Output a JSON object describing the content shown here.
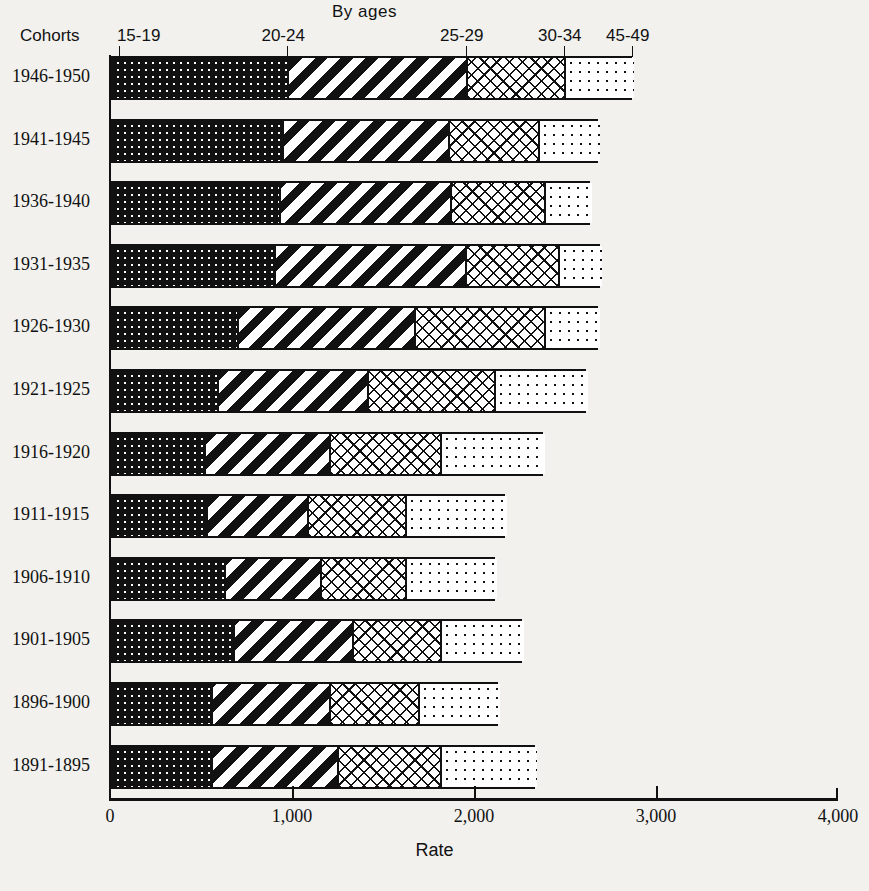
{
  "header": {
    "by_ages": "By ages",
    "cohorts_label": "Cohorts"
  },
  "axis": {
    "x_title": "Rate",
    "x_ticks": [
      "0",
      "1,000",
      "2,000",
      "3,000",
      "4,000"
    ],
    "x_tick_values": [
      0,
      1000,
      2000,
      3000,
      4000
    ]
  },
  "age_headers": [
    {
      "label": "15-19",
      "x_rate": 60
    },
    {
      "label": "20-24",
      "x_rate": 975
    },
    {
      "label": "25-29",
      "x_rate": 1956
    },
    {
      "label": "30-34",
      "x_rate": 2495
    },
    {
      "label": "45-49",
      "x_rate": 2868
    }
  ],
  "chart_data": {
    "type": "bar",
    "orientation": "horizontal",
    "stacked": true,
    "title": "By ages",
    "xlabel": "Rate",
    "ylabel": "Cohorts",
    "xlim": [
      0,
      4000
    ],
    "grid": false,
    "legend_position": "top (inline age-group callouts)",
    "categories": [
      "1946-1950",
      "1941-1945",
      "1936-1940",
      "1931-1935",
      "1926-1930",
      "1921-1925",
      "1916-1920",
      "1911-1915",
      "1906-1910",
      "1901-1905",
      "1896-1900",
      "1891-1895"
    ],
    "series": [
      {
        "name": "15-19",
        "pattern": "dark-dotted",
        "values": [
          975,
          945,
          929,
          901,
          698,
          588,
          516,
          527,
          626,
          676,
          555,
          555
        ]
      },
      {
        "name": "20-24",
        "pattern": "diagonal-stripes",
        "values": [
          981,
          912,
          939,
          1050,
          972,
          824,
          687,
          555,
          528,
          654,
          648,
          692
        ]
      },
      {
        "name": "25-29",
        "pattern": "cross-hatch",
        "values": [
          539,
          495,
          517,
          511,
          715,
          698,
          610,
          539,
          467,
          483,
          489,
          566
        ]
      },
      {
        "name": "30-34",
        "pattern": "light-dots",
        "values": [
          373,
          329,
          252,
          230,
          296,
          505,
          566,
          549,
          494,
          451,
          440,
          522
        ]
      }
    ],
    "cumulative_boundaries": [
      [
        975,
        1956,
        2495,
        2868
      ],
      [
        945,
        1857,
        2352,
        2681
      ],
      [
        929,
        1868,
        2385,
        2637
      ],
      [
        901,
        1951,
        2462,
        2692
      ],
      [
        698,
        1670,
        2385,
        2681
      ],
      [
        588,
        1412,
        2110,
        2615
      ],
      [
        516,
        1203,
        1813,
        2379
      ],
      [
        527,
        1082,
        1621,
        2170
      ],
      [
        626,
        1154,
        1621,
        2115
      ],
      [
        676,
        1330,
        1813,
        2264
      ],
      [
        555,
        1203,
        1692,
        2132
      ],
      [
        555,
        1247,
        1813,
        2335
      ]
    ],
    "totals": [
      2868,
      2681,
      2637,
      2692,
      2681,
      2615,
      2379,
      2170,
      2115,
      2264,
      2132,
      2335
    ]
  },
  "colors": {
    "ink": "#111111",
    "paper": "#f2f1ee",
    "segment_fill": "#ffffff"
  }
}
